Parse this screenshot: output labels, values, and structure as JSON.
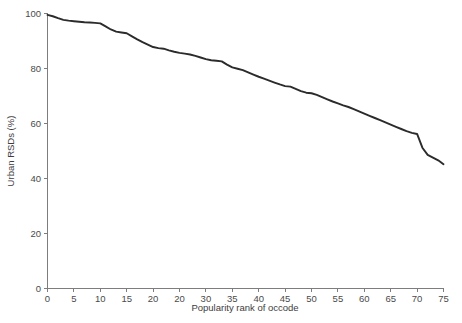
{
  "chart_data": {
    "type": "line",
    "title": "",
    "subtitle": "",
    "xlabel": "Popularity rank of occode",
    "ylabel": "Urban RSDs (%)",
    "xlim": [
      0,
      75
    ],
    "ylim": [
      0,
      100
    ],
    "grid": false,
    "legend": false,
    "legend_position": "none",
    "line_color": "#2b2b2b",
    "axis_color": "#7d7d7d",
    "text_color": "#4a4a4a",
    "xticks": [
      0,
      5,
      10,
      15,
      20,
      25,
      30,
      35,
      40,
      45,
      50,
      55,
      60,
      65,
      70,
      75
    ],
    "xticklabels": [
      "0",
      "5",
      "10",
      "15",
      "20",
      "20",
      "30",
      "35",
      "40",
      "45",
      "50",
      "55",
      "60",
      "65",
      "70",
      "75"
    ],
    "yticks": [
      0,
      20,
      40,
      60,
      80,
      100
    ],
    "yticklabels": [
      "0",
      "20",
      "40",
      "60",
      "80",
      "100"
    ],
    "series": [
      {
        "name": "Urban RSDs",
        "x": [
          0,
          1,
          2,
          3,
          4,
          5,
          6,
          7,
          8,
          9,
          10,
          11,
          12,
          13,
          14,
          15,
          16,
          17,
          18,
          19,
          20,
          21,
          22,
          23,
          24,
          25,
          26,
          27,
          28,
          29,
          30,
          31,
          32,
          33,
          34,
          35,
          36,
          37,
          38,
          39,
          40,
          41,
          42,
          43,
          44,
          45,
          46,
          47,
          48,
          49,
          50,
          51,
          52,
          53,
          54,
          55,
          56,
          57,
          58,
          59,
          60,
          61,
          62,
          63,
          64,
          65,
          66,
          67,
          68,
          69,
          70,
          71,
          72,
          73,
          74,
          75
        ],
        "values": [
          99.5,
          99.0,
          98.3,
          97.7,
          97.4,
          97.2,
          97.0,
          96.8,
          96.7,
          96.6,
          96.4,
          95.3,
          94.2,
          93.4,
          93.1,
          92.8,
          91.7,
          90.6,
          89.6,
          88.7,
          87.8,
          87.4,
          87.2,
          86.6,
          86.1,
          85.7,
          85.4,
          85.1,
          84.6,
          84.0,
          83.4,
          83.0,
          82.8,
          82.6,
          81.4,
          80.4,
          79.9,
          79.4,
          78.6,
          77.8,
          77.0,
          76.3,
          75.6,
          74.9,
          74.2,
          73.6,
          73.4,
          72.6,
          71.8,
          71.2,
          71.0,
          70.4,
          69.6,
          68.8,
          68.0,
          67.3,
          66.6,
          66.0,
          65.2,
          64.4,
          63.6,
          62.8,
          62.0,
          61.2,
          60.4,
          59.6,
          58.8,
          58.0,
          57.2,
          56.6,
          56.2,
          51.2,
          48.6,
          47.6,
          46.6,
          45.2
        ]
      }
    ]
  },
  "axis": {
    "y_title": "Urban RSDs (%)",
    "x_title": "Popularity rank of occode"
  }
}
